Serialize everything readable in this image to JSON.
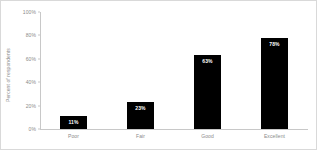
{
  "chart_data": {
    "type": "bar",
    "title": "",
    "subtitle": "",
    "xlabel": "",
    "ylabel": "Percent of respondents",
    "categories": [
      "Poor",
      "Fair",
      "Good",
      "Excellent"
    ],
    "values": [
      11,
      23,
      63,
      78
    ],
    "data_labels": [
      "11%",
      "23%",
      "63%",
      "78%"
    ],
    "ylim": [
      0,
      100
    ],
    "y_ticks": [
      0,
      20,
      40,
      60,
      80,
      100
    ],
    "y_tick_labels": [
      "0%",
      "20%",
      "40%",
      "60%",
      "80%",
      "100%"
    ],
    "grid": false,
    "legend": null,
    "legend_position": "none",
    "series": [
      {
        "name": "Percent of respondents",
        "values": [
          11,
          23,
          63,
          78
        ]
      }
    ],
    "colors": {
      "bar": "#000000",
      "data_label": "#ffffff",
      "axis_text": "#8a8a8a",
      "axis_line": "#c8c8c8",
      "background": "#ffffff",
      "figure_border": "#d9d9d9"
    }
  }
}
